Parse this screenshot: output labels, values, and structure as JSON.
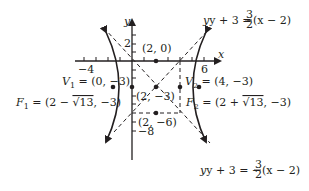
{
  "diagram": {
    "type": "hyperbola",
    "equation_center": [
      2,
      -3
    ],
    "a": 2,
    "b": 3,
    "axes": {
      "x_label": "x",
      "y_label": "y",
      "x_tick_labels": [
        "−4",
        "6"
      ],
      "y_tick_labels": [
        "2",
        "−8"
      ]
    },
    "labels": {
      "asymptote_upper": "y + 3 = ",
      "asymptote_upper_frac_num": "3",
      "asymptote_upper_frac_den": "2",
      "asymptote_upper_tail": "(x − 2)",
      "asymptote_lower": "y + 3 = −",
      "asymptote_lower_frac_num": "3",
      "asymptote_lower_frac_den": "2",
      "asymptote_lower_tail": "(x − 2)",
      "point_top": "(2, 0)",
      "center": "(2, −3)",
      "point_bottom": "(2, −6)",
      "v1": "V",
      "v1_sub": "1",
      "v1_val": " = (0, −3)",
      "v2": "V",
      "v2_sub": "2",
      "v2_val": " = (4, −3)",
      "f1": "F",
      "f1_sub": "1",
      "f1_val_a": " = (2 − ",
      "f1_sqrt": "√13",
      "f1_val_b": ", −3)",
      "f2": "F",
      "f2_sub": "2",
      "f2_val_a": " = (2 + ",
      "f2_sqrt": "√13",
      "f2_val_b": ", −3)"
    },
    "points": [
      {
        "name": "(2, 0)",
        "x": 2,
        "y": 0
      },
      {
        "name": "center",
        "x": 2,
        "y": -3
      },
      {
        "name": "(2, -6)",
        "x": 2,
        "y": -6
      },
      {
        "name": "V1",
        "x": 0,
        "y": -3
      },
      {
        "name": "V2",
        "x": 4,
        "y": -3
      },
      {
        "name": "F1",
        "x": -1.606,
        "y": -3
      },
      {
        "name": "F2",
        "x": 5.606,
        "y": -3
      }
    ],
    "colors": {
      "ink": "#231f20",
      "background": "#ffffff"
    }
  }
}
